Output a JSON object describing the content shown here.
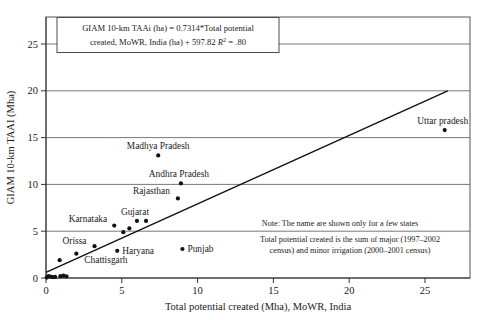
{
  "figure": {
    "background_color": "#ffffff",
    "ink_color": "#111111",
    "grid_color": "#555555"
  },
  "chart_data": {
    "type": "scatter",
    "title": "",
    "xlabel": "Total potential created (Mha), MoWR, India",
    "ylabel": "GIAM 10-km TAAI (Mha)",
    "xlim": [
      0,
      28
    ],
    "ylim": [
      0,
      27.5
    ],
    "xticks": [
      0,
      5,
      10,
      15,
      20,
      25
    ],
    "yticks": [
      0,
      5,
      10,
      15,
      20,
      25
    ],
    "xticklabels": [
      "0",
      "5",
      "10",
      "15",
      "20",
      "25"
    ],
    "yticklabels": [
      "0",
      "5",
      "10",
      "15",
      "20",
      "25"
    ],
    "grid": "horizontal-only",
    "legend": "none",
    "equation_text_line1": "GIAM 10-km TAAi (ha) = 0.7314*Total potential",
    "equation_text_line2a": "created, MoWR, India (ha) + 597.82 ",
    "equation_text_r": "R",
    "equation_text_sup": "2",
    "equation_text_line2b": " = .80",
    "regression": {
      "slope": 0.7314,
      "intercept": 0.5978,
      "r_squared": 0.8,
      "line_x": [
        0.0,
        26.5
      ],
      "line_y": [
        0.6,
        20.0
      ]
    },
    "note_line1": "Note: The name are shown only for a few states",
    "note_line2": "Total potential created is the sum of major (1997–2002",
    "note_line3": "census) and minor irrigation (2000–2001 census)",
    "points": [
      {
        "label": "Uttar pradesh",
        "x": 26.3,
        "y": 15.8,
        "label_dx": -2,
        "label_dy": -6,
        "anchor": "middle"
      },
      {
        "label": "Madhya Pradesh",
        "x": 7.4,
        "y": 13.1,
        "label_dx": 0,
        "label_dy": -6,
        "anchor": "middle"
      },
      {
        "label": "Andhra Pradesh",
        "x": 8.9,
        "y": 10.1,
        "label_dx": -2,
        "label_dy": -6,
        "anchor": "middle"
      },
      {
        "label": "Rajasthan",
        "x": 8.7,
        "y": 8.5,
        "label_dx": -8,
        "label_dy": -4,
        "anchor": "end"
      },
      {
        "label": "Gujarat",
        "x": 6.0,
        "y": 6.1,
        "label_dx": -2,
        "label_dy": -6,
        "anchor": "middle"
      },
      {
        "label": "Karnataka",
        "x": 4.5,
        "y": 5.6,
        "label_dx": -7,
        "label_dy": -4,
        "anchor": "end"
      },
      {
        "label": "Punjab",
        "x": 9.0,
        "y": 3.1,
        "label_dx": 5,
        "label_dy": 3,
        "anchor": "start"
      },
      {
        "label": "Haryana",
        "x": 4.7,
        "y": 2.9,
        "label_dx": 5,
        "label_dy": 3,
        "anchor": "start"
      },
      {
        "label": "Orissa",
        "x": 3.2,
        "y": 3.4,
        "label_dx": -8,
        "label_dy": -2,
        "anchor": "end"
      },
      {
        "label": "Chattisgarh",
        "x": 2.0,
        "y": 2.6,
        "label_dx": 8,
        "label_dy": 9,
        "anchor": "start"
      },
      {
        "label": "",
        "x": 6.6,
        "y": 6.1,
        "label_dx": 0,
        "label_dy": 0,
        "anchor": "middle"
      },
      {
        "label": "",
        "x": 5.5,
        "y": 5.3,
        "label_dx": 0,
        "label_dy": 0,
        "anchor": "middle"
      },
      {
        "label": "",
        "x": 5.1,
        "y": 4.9,
        "label_dx": 0,
        "label_dy": 0,
        "anchor": "middle"
      },
      {
        "label": "",
        "x": 0.9,
        "y": 1.9,
        "label_dx": 0,
        "label_dy": 0,
        "anchor": "middle"
      },
      {
        "label": "",
        "x": 0.15,
        "y": 0.2,
        "label_dx": 0,
        "label_dy": 0,
        "anchor": "middle"
      },
      {
        "label": "",
        "x": 0.3,
        "y": 0.15,
        "label_dx": 0,
        "label_dy": 0,
        "anchor": "middle"
      },
      {
        "label": "",
        "x": 0.45,
        "y": 0.1,
        "label_dx": 0,
        "label_dy": 0,
        "anchor": "middle"
      },
      {
        "label": "",
        "x": 0.6,
        "y": 0.12,
        "label_dx": 0,
        "label_dy": 0,
        "anchor": "middle"
      },
      {
        "label": "",
        "x": 0.95,
        "y": 0.2,
        "label_dx": 0,
        "label_dy": 0,
        "anchor": "middle"
      },
      {
        "label": "",
        "x": 1.15,
        "y": 0.25,
        "label_dx": 0,
        "label_dy": 0,
        "anchor": "middle"
      },
      {
        "label": "",
        "x": 1.35,
        "y": 0.18,
        "label_dx": 0,
        "label_dy": 0,
        "anchor": "middle"
      },
      {
        "label": "",
        "x": 0.05,
        "y": 0.05,
        "label_dx": 0,
        "label_dy": 0,
        "anchor": "middle"
      }
    ]
  }
}
